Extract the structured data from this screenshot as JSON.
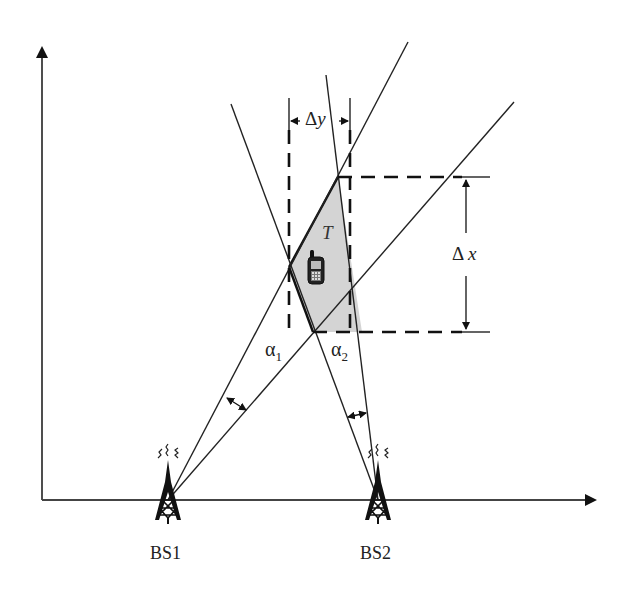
{
  "diagram": {
    "type": "AOA positioning geometry",
    "stations": [
      {
        "id": "bs1",
        "label": "BS1",
        "x": 168,
        "y": 500
      },
      {
        "id": "bs2",
        "label": "BS2",
        "x": 378,
        "y": 500
      }
    ],
    "target": {
      "label": "T"
    },
    "angles": [
      {
        "symbol": "α",
        "sub": "1"
      },
      {
        "symbol": "α",
        "sub": "2"
      }
    ],
    "dimensions": {
      "dy": {
        "symbol": "Δ",
        "var": "y"
      },
      "dx": {
        "symbol": "Δ",
        "var": "x"
      }
    },
    "colors": {
      "line": "#222222",
      "region_fill": "#d4d4d4",
      "background": "#ffffff"
    }
  }
}
